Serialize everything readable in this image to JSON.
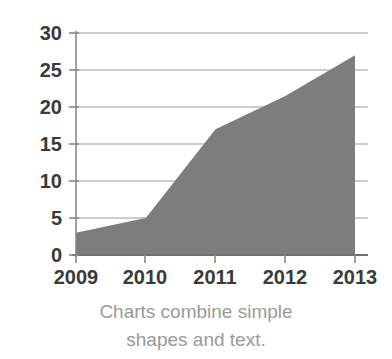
{
  "chart_data": {
    "type": "area",
    "title": "",
    "subtitle": "",
    "xlabel": "",
    "ylabel": "",
    "categories": [
      "2009",
      "2010",
      "2011",
      "2012",
      "2013"
    ],
    "x": [
      2009,
      2010,
      2011,
      2012,
      2013
    ],
    "values": [
      3,
      5,
      17,
      21.5,
      27
    ],
    "series": [
      {
        "name": "",
        "values": [
          3,
          5,
          17,
          21.5,
          27
        ]
      }
    ],
    "ylim": [
      0,
      30
    ],
    "xlim": [
      2009,
      2013
    ],
    "y_ticks": [
      0,
      5,
      10,
      15,
      20,
      25,
      30
    ],
    "y_tick_labels": [
      "0",
      "5",
      "10",
      "15",
      "20",
      "25",
      "30"
    ],
    "x_ticks": [
      2009,
      2010,
      2011,
      2012,
      2013
    ],
    "x_tick_labels": [
      "2009",
      "2010",
      "2011",
      "2012",
      "2013"
    ],
    "grid": "horizontal",
    "legend": "none",
    "annotations": [],
    "colors": {
      "area_fill": "#7d7d7d",
      "gridline": "#b8b8b8",
      "axis": "#7a7a7a",
      "tick_label": "#3a3a3a",
      "caption": "#9a9a9a",
      "background": "#ffffff"
    }
  },
  "caption": {
    "line1": "Charts combine simple",
    "line2": "shapes and text."
  }
}
